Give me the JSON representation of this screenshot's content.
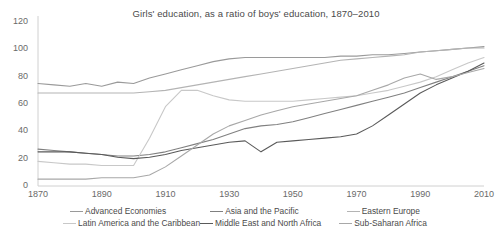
{
  "chart_data": {
    "type": "line",
    "title": "Girls' education, as a ratio of boys' education, 1870–2010",
    "xlabel": "",
    "ylabel": "",
    "xlim": [
      1870,
      2010
    ],
    "ylim": [
      0,
      120
    ],
    "ytick_labels": [
      "0",
      "20",
      "40",
      "60",
      "80",
      "100",
      "120"
    ],
    "yticks": [
      0,
      20,
      40,
      60,
      80,
      100,
      120
    ],
    "xtick_labels": [
      "1870",
      "1890",
      "1910",
      "1930",
      "1950",
      "1970",
      "1990",
      "2010"
    ],
    "xticks": [
      1870,
      1890,
      1910,
      1930,
      1950,
      1970,
      1990,
      2010
    ],
    "grid": false,
    "legend_position": "bottom",
    "x": [
      1870,
      1875,
      1880,
      1885,
      1890,
      1895,
      1900,
      1905,
      1910,
      1915,
      1920,
      1925,
      1930,
      1935,
      1940,
      1945,
      1950,
      1955,
      1960,
      1965,
      1970,
      1975,
      1980,
      1985,
      1990,
      1995,
      2000,
      2005,
      2010
    ],
    "series": [
      {
        "name": "Advanced Economies",
        "color": "#9a9a9a",
        "values": [
          75,
          74,
          73,
          75,
          73,
          76,
          75,
          79,
          82,
          85,
          88,
          91,
          93,
          94,
          94,
          94,
          94,
          94,
          94,
          95,
          95,
          96,
          96,
          97,
          98,
          99,
          100,
          101,
          102
        ]
      },
      {
        "name": "Asia and the Pacific",
        "color": "#808080",
        "values": [
          27,
          26,
          25,
          24,
          23,
          22,
          22,
          23,
          25,
          28,
          31,
          34,
          38,
          42,
          44,
          45,
          47,
          50,
          53,
          56,
          59,
          62,
          65,
          68,
          72,
          76,
          80,
          84,
          88
        ]
      },
      {
        "name": "Eastern Europe",
        "color": "#b4b4b4",
        "values": [
          68,
          68,
          68,
          68,
          68,
          68,
          68,
          69,
          70,
          72,
          74,
          76,
          78,
          80,
          82,
          84,
          86,
          88,
          90,
          92,
          93,
          94,
          95,
          96,
          98,
          99,
          100,
          101,
          101
        ]
      },
      {
        "name": "Latin America and the Caribbean",
        "color": "#c8c8c8",
        "values": [
          18,
          17,
          16,
          16,
          15,
          15,
          15,
          35,
          58,
          70,
          70,
          66,
          63,
          62,
          62,
          62,
          62,
          63,
          64,
          65,
          66,
          68,
          70,
          73,
          76,
          80,
          85,
          90,
          94
        ]
      },
      {
        "name": "Middle East and North Africa",
        "color": "#5a5a5a",
        "values": [
          25,
          25,
          25,
          24,
          23,
          21,
          20,
          21,
          23,
          26,
          28,
          30,
          32,
          33,
          25,
          32,
          33,
          34,
          35,
          36,
          38,
          44,
          52,
          60,
          68,
          74,
          79,
          84,
          90
        ]
      },
      {
        "name": "Sub-Saharan Africa",
        "color": "#a8a8a8",
        "values": [
          5,
          5,
          5,
          5,
          6,
          6,
          6,
          8,
          14,
          22,
          30,
          38,
          44,
          48,
          52,
          55,
          58,
          60,
          62,
          64,
          66,
          70,
          74,
          79,
          82,
          78,
          80,
          83,
          86
        ]
      }
    ]
  },
  "legend": {
    "rows": [
      [
        "Advanced Economies",
        "Asia and the Pacific",
        "Eastern Europe"
      ],
      [
        "Latin America and the Caribbean",
        "Middle East and North Africa",
        "Sub-Saharan Africa"
      ]
    ]
  }
}
